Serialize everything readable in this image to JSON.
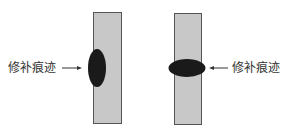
{
  "figure": {
    "left_panel": {
      "label": "修补痕迹",
      "description": "vertical ellipse repair mark on left edge of bar"
    },
    "right_panel": {
      "label": "修补痕迹",
      "description": "horizontal ellipse repair mark across bar"
    },
    "colors": {
      "bar_fill": "#c8c8c8",
      "bar_stroke": "#555555",
      "mark_fill": "#1a1a1a",
      "text": "#333333"
    }
  }
}
